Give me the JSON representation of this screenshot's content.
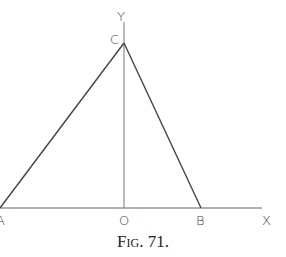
{
  "figure": {
    "caption_prefix": "Fig.",
    "caption_number": "71.",
    "points": {
      "A": {
        "label": "A",
        "x": 0,
        "y": 208
      },
      "B": {
        "label": "B",
        "x": 201,
        "y": 208
      },
      "C": {
        "label": "C",
        "x": 124,
        "y": 43
      },
      "O": {
        "label": "O",
        "x": 124,
        "y": 208
      }
    },
    "axes": {
      "x_label": "X",
      "y_label": "Y"
    },
    "segments": [
      {
        "from": "A",
        "to": "C"
      },
      {
        "from": "C",
        "to": "B"
      },
      {
        "from": "C",
        "to": "O"
      }
    ],
    "line_color": "#555555"
  }
}
